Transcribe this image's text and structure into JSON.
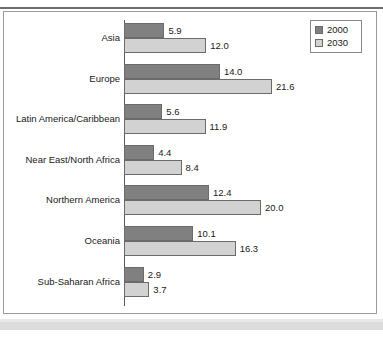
{
  "chart_data": {
    "type": "bar",
    "orientation": "horizontal",
    "title": "",
    "xlabel": "",
    "ylabel": "",
    "grid": false,
    "legend_position": "top-right",
    "xlim": [
      0,
      21.6
    ],
    "categories": [
      "Asia",
      "Europe",
      "Latin America/Caribbean",
      "Near East/North Africa",
      "Northern America",
      "Oceania",
      "Sub-Saharan Africa"
    ],
    "series": [
      {
        "name": "2000",
        "color": "#808080",
        "values": [
          5.9,
          14.0,
          5.6,
          4.4,
          12.4,
          10.1,
          2.9
        ],
        "labels": [
          "5.9",
          "14.0",
          "5.6",
          "4.4",
          "12.4",
          "10.1",
          "2.9"
        ]
      },
      {
        "name": "2030",
        "color": "#d2d2d2",
        "values": [
          12.0,
          21.6,
          11.9,
          8.4,
          20.0,
          16.3,
          3.7
        ],
        "labels": [
          "12.0",
          "21.6",
          "11.9",
          "8.4",
          "20.0",
          "16.3",
          "3.7"
        ]
      }
    ]
  },
  "legend": {
    "items": [
      {
        "label": "2000",
        "swatch": "s2000"
      },
      {
        "label": "2030",
        "swatch": "s2030"
      }
    ]
  },
  "colors": {
    "series_2000": "#808080",
    "series_2030": "#d2d2d2",
    "frame_border": "#9a9a9a",
    "axis": "#5a5a5a",
    "bottom_band": "#dcdcdc",
    "background": "#ffffff"
  }
}
